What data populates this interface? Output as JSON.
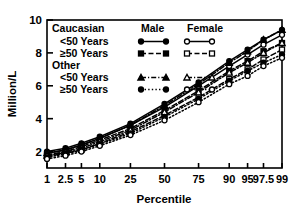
{
  "chart_data": {
    "type": "line",
    "title": "",
    "xlabel": "Percentile",
    "ylabel": "Million/L",
    "x_scale": "probit",
    "xticks": [
      "1",
      "2.5",
      "5",
      "10",
      "25",
      "50",
      "75",
      "90",
      "95",
      "97.5",
      "99"
    ],
    "xtick_values": [
      1,
      2.5,
      5,
      10,
      25,
      50,
      75,
      90,
      95,
      97.5,
      99
    ],
    "yticks": [
      "2",
      "4",
      "6",
      "8",
      "10"
    ],
    "ytick_values": [
      2,
      4,
      6,
      8,
      10
    ],
    "ylim": [
      1,
      10
    ],
    "grid": false,
    "legend_position": "upper-left-inside",
    "legend": {
      "group_headers": [
        "Caucasian",
        "Other"
      ],
      "column_headers": [
        "Male",
        "Female"
      ],
      "row_labels": [
        "<50 Years",
        "≥50 Years",
        "<50 Years",
        "≥50 Years"
      ]
    },
    "series": [
      {
        "name": "Caucasian Male <50 Years",
        "group": "Caucasian",
        "sex": "Male",
        "age": "<50 Years",
        "marker": "filled-circle",
        "line": "solid",
        "color": "#000000",
        "x": [
          1,
          2.5,
          5,
          10,
          25,
          50,
          75,
          90,
          95,
          97.5,
          99
        ],
        "values": [
          2.0,
          2.2,
          2.5,
          2.9,
          3.7,
          4.9,
          6.2,
          7.5,
          8.2,
          8.8,
          9.4
        ]
      },
      {
        "name": "Caucasian Female <50 Years",
        "group": "Caucasian",
        "sex": "Female",
        "age": "<50 Years",
        "marker": "open-circle",
        "line": "solid",
        "color": "#000000",
        "x": [
          1,
          2.5,
          5,
          10,
          25,
          50,
          75,
          90,
          95,
          97.5,
          99
        ],
        "values": [
          1.9,
          2.1,
          2.4,
          2.8,
          3.6,
          4.7,
          6.0,
          7.2,
          7.9,
          8.5,
          9.1
        ]
      },
      {
        "name": "Caucasian Male ≥50 Years",
        "group": "Caucasian",
        "sex": "Male",
        "age": "≥50 Years",
        "marker": "filled-square",
        "line": "dashed",
        "color": "#000000",
        "x": [
          1,
          2.5,
          5,
          10,
          25,
          50,
          75,
          90,
          95,
          97.5,
          99
        ],
        "values": [
          1.8,
          2.0,
          2.3,
          2.7,
          3.4,
          4.5,
          5.7,
          6.9,
          7.5,
          8.1,
          8.6
        ]
      },
      {
        "name": "Caucasian Female ≥50 Years",
        "group": "Caucasian",
        "sex": "Female",
        "age": "≥50 Years",
        "marker": "open-square",
        "line": "dashed",
        "color": "#000000",
        "x": [
          1,
          2.5,
          5,
          10,
          25,
          50,
          75,
          90,
          95,
          97.5,
          99
        ],
        "values": [
          1.7,
          1.9,
          2.1,
          2.5,
          3.2,
          4.2,
          5.3,
          6.4,
          7.0,
          7.6,
          8.2
        ]
      },
      {
        "name": "Other Male <50 Years",
        "group": "Other",
        "sex": "Male",
        "age": "<50 Years",
        "marker": "filled-triangle",
        "line": "dash-dot",
        "color": "#000000",
        "x": [
          1,
          2.5,
          5,
          10,
          25,
          50,
          75,
          90,
          95,
          97.5,
          99
        ],
        "values": [
          1.9,
          2.1,
          2.4,
          2.8,
          3.6,
          4.8,
          6.1,
          7.4,
          8.1,
          8.8,
          9.4
        ]
      },
      {
        "name": "Other Female <50 Years",
        "group": "Other",
        "sex": "Female",
        "age": "<50 Years",
        "marker": "open-triangle",
        "line": "dash-dot",
        "color": "#000000",
        "x": [
          1,
          2.5,
          5,
          10,
          25,
          50,
          75,
          90,
          95,
          97.5,
          99
        ],
        "values": [
          1.75,
          1.95,
          2.2,
          2.6,
          3.3,
          4.4,
          5.6,
          6.8,
          7.4,
          8.0,
          8.6
        ]
      },
      {
        "name": "Other Male ≥50 Years",
        "group": "Other",
        "sex": "Male",
        "age": "≥50 Years",
        "marker": "filled-circle",
        "line": "dotted",
        "color": "#000000",
        "x": [
          1,
          2.5,
          5,
          10,
          25,
          50,
          75,
          90,
          95,
          97.5,
          99
        ],
        "values": [
          1.65,
          1.85,
          2.1,
          2.45,
          3.1,
          4.1,
          5.2,
          6.3,
          6.9,
          7.4,
          7.9
        ]
      },
      {
        "name": "Other Female ≥50 Years",
        "group": "Other",
        "sex": "Female",
        "age": "≥50 Years",
        "marker": "open-circle",
        "line": "dotted",
        "color": "#000000",
        "x": [
          1,
          2.5,
          5,
          10,
          25,
          50,
          75,
          90,
          95,
          97.5,
          99
        ],
        "values": [
          1.55,
          1.75,
          2.0,
          2.35,
          3.0,
          3.9,
          5.0,
          6.1,
          6.6,
          7.2,
          7.7
        ]
      }
    ]
  },
  "axes": {
    "ylabel": "Million/L",
    "xlabel": "Percentile"
  },
  "legend_items": [
    {
      "label": "Caucasian",
      "type": "header"
    },
    {
      "label": "<50 Years",
      "type": "row"
    },
    {
      "label": "≥50 Years",
      "type": "row"
    },
    {
      "label": "Other",
      "type": "header"
    },
    {
      "label": "<50 Years",
      "type": "row"
    },
    {
      "label": "≥50 Years",
      "type": "row"
    }
  ],
  "legend_columns": {
    "male": "Male",
    "female": "Female"
  }
}
